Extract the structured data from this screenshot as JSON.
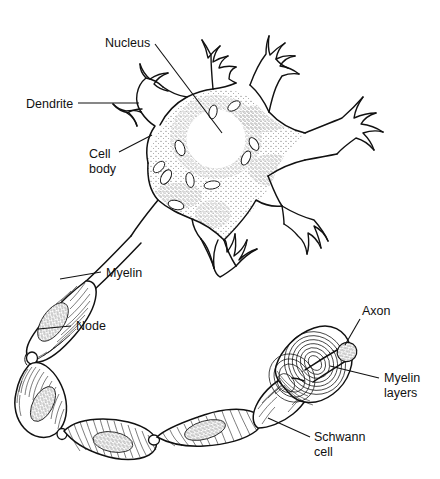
{
  "figure": {
    "type": "line-art anatomical illustration",
    "background_color": "#ffffff",
    "ink_color": "#111111"
  },
  "labels": [
    {
      "id": "nucleus",
      "text": "Nucleus",
      "text2": "",
      "x": 105,
      "y": 47,
      "anchor": "start"
    },
    {
      "id": "dendrite",
      "text": "Dendrite",
      "text2": "",
      "x": 26,
      "y": 108,
      "anchor": "start"
    },
    {
      "id": "cell-body",
      "text": "Cell",
      "text2": "body",
      "x": 89,
      "y": 158,
      "anchor": "start"
    },
    {
      "id": "myelin",
      "text": "Myelin",
      "text2": "",
      "x": 106,
      "y": 277,
      "anchor": "start"
    },
    {
      "id": "node",
      "text": "Node",
      "text2": "",
      "x": 76,
      "y": 330,
      "anchor": "start"
    },
    {
      "id": "axon",
      "text": "Axon",
      "text2": "",
      "x": 362,
      "y": 315,
      "anchor": "start"
    },
    {
      "id": "myelin-layers",
      "text": "Myelin",
      "text2": "layers",
      "x": 384,
      "y": 382,
      "anchor": "start"
    },
    {
      "id": "schwann-cell",
      "text": "Schwann",
      "text2": "cell",
      "x": 314,
      "y": 441,
      "anchor": "start"
    }
  ],
  "leaders": [
    {
      "id": "nucleus-leader",
      "d": "M 155 44 L 222 133"
    },
    {
      "id": "dendrite-leader",
      "d": "M 78 103 L 139 103"
    },
    {
      "id": "cell-body-leader",
      "d": "M 119 152 L 152 135"
    },
    {
      "id": "myelin-leader",
      "d": "M 101 272 L 60 279"
    },
    {
      "id": "node-leader",
      "d": "M 71 326 L 38 329"
    },
    {
      "id": "axon-leader",
      "d": "M 360 319 L 345 345"
    },
    {
      "id": "myelin-layers-leader",
      "d": "M 379 378 L 330 366"
    },
    {
      "id": "schwann-leader",
      "d": "M 310 437 L 268 418"
    }
  ],
  "parts": {
    "soma": "cell body with stippled cytoplasm and clear round nucleus",
    "dendrites": "six branching dendrites with finger-like terminal tips",
    "axon": "long axon leaving soma, curving left and around bottom",
    "myelin_segments": "seven sausage-shaped myelinated Schwann-cell segments with transverse hatching",
    "nodes": "narrow pinch points (nodes of Ranvier) between myelin segments",
    "cutaway": "cut-away spiral showing concentric myelin layers wrapping the axon core"
  }
}
